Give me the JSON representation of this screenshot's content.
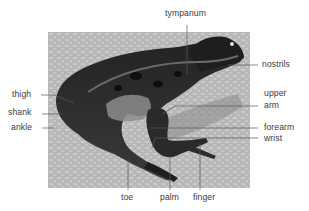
{
  "diagram": {
    "labels": [
      {
        "id": "tympanum",
        "text": "tympanum"
      },
      {
        "id": "nostrils",
        "text": "nostrils"
      },
      {
        "id": "thigh",
        "text": "thigh"
      },
      {
        "id": "shank",
        "text": "shank"
      },
      {
        "id": "ankle",
        "text": "ankle"
      },
      {
        "id": "upper_arm_1",
        "text": "upper"
      },
      {
        "id": "upper_arm_2",
        "text": "arm"
      },
      {
        "id": "forearm",
        "text": "forearm"
      },
      {
        "id": "wrist",
        "text": "wrist"
      },
      {
        "id": "toe",
        "text": "toe"
      },
      {
        "id": "palm",
        "text": "palm"
      },
      {
        "id": "finger",
        "text": "finger"
      }
    ],
    "colors": {
      "background": "#ffffff",
      "photo_bg": "#b9b9b9",
      "frog_dark": "#1a1a1a",
      "frog_mid": "#4a4a4a",
      "belly": "#8c8c8c",
      "leader_line": "#5a5a5a",
      "label_text": "#3a3a3a"
    }
  }
}
